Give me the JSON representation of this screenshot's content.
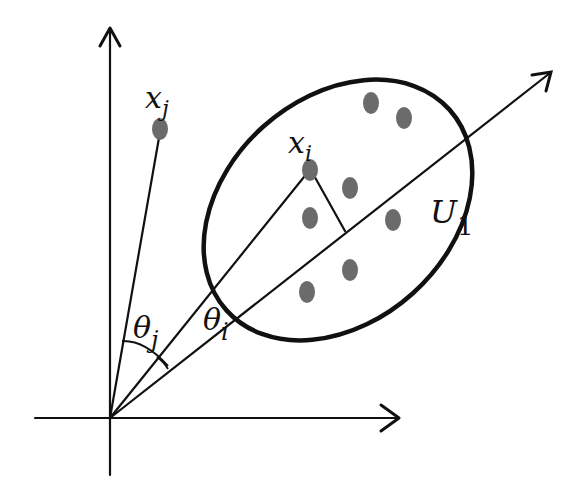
{
  "diagram": {
    "type": "PCA projection diagram",
    "colors": {
      "line": "#111111",
      "point": "#6b6b6b",
      "background": "#ffffff"
    },
    "axes": {
      "origin": [
        110,
        418
      ],
      "x_axis": {
        "from": [
          35,
          418
        ],
        "to": [
          400,
          418
        ]
      },
      "y_axis": {
        "from": [
          110,
          475
        ],
        "to": [
          110,
          27
        ]
      },
      "principal_axis": {
        "from": [
          110,
          418
        ],
        "to": [
          552,
          72
        ],
        "label": "U",
        "label_sub": "1"
      }
    },
    "labels": {
      "xj": {
        "main": "x",
        "sub": "j"
      },
      "xi": {
        "main": "x",
        "sub": "i"
      },
      "theta_j": {
        "main": "θ",
        "sub": "j"
      },
      "theta_i": {
        "main": "θ",
        "sub": "i"
      },
      "u1": {
        "main": "U",
        "sub": "1"
      }
    },
    "points": {
      "xj": [
        160,
        129
      ],
      "xi": [
        310,
        170
      ],
      "cluster": [
        [
          371,
          103
        ],
        [
          404,
          118
        ],
        [
          350,
          188
        ],
        [
          310,
          218
        ],
        [
          393,
          220
        ],
        [
          350,
          270
        ],
        [
          307,
          292
        ]
      ]
    },
    "projection_foot": [
      345,
      231
    ],
    "ellipse": {
      "cx": 338,
      "cy": 210,
      "rx": 150,
      "ry": 110,
      "rotation": -40
    }
  }
}
